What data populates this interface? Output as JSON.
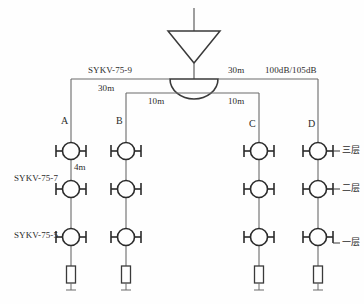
{
  "diagram": {
    "background_color": "#fefefe",
    "line_color": "#3a3a3a",
    "text_color": "#2b2b2b"
  },
  "source": {
    "antenna_feed_label": "",
    "amplifier_icon": "amplifier-triangle-icon",
    "splitter_icon": "splitter-semicircle-icon"
  },
  "trunk": {
    "cable_type_left": "SYKV-75-9",
    "length_left": "30m",
    "length_right": "30m",
    "gain_label": "100dB/105dB",
    "length_inner_left": "10m",
    "length_inner_right": "10m"
  },
  "risers": {
    "cable_type_upper": "SYKV-75-7",
    "cable_type_lower": "SYKV-75-5",
    "spacing_label": "4m"
  },
  "branches": [
    {
      "id": "A",
      "label": "A",
      "x": 71
    },
    {
      "id": "B",
      "label": "B",
      "x": 126
    },
    {
      "id": "C",
      "label": "C",
      "x": 259
    },
    {
      "id": "D",
      "label": "D",
      "x": 318
    }
  ],
  "floors": [
    {
      "label": "三层",
      "y": 151
    },
    {
      "label": "二层",
      "y": 189
    },
    {
      "label": "一层",
      "y": 237
    }
  ],
  "tap_icon": "tap-coupler-icon",
  "outlet_icon": "tv-outlet-icon"
}
